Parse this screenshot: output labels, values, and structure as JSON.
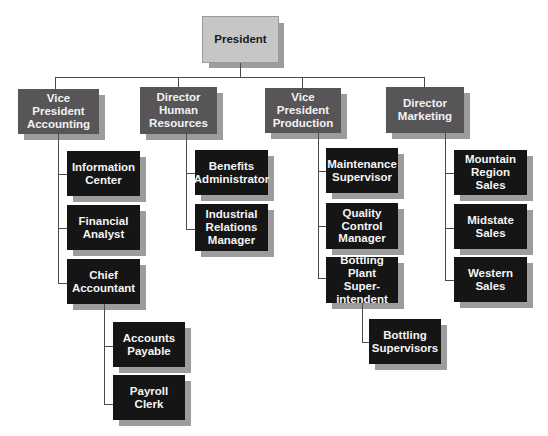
{
  "heading_fragment": "row",
  "chart": {
    "top": {
      "label": "President"
    },
    "departments": [
      {
        "label": "Vice President\nAccounting",
        "children": [
          {
            "label": "Information\nCenter"
          },
          {
            "label": "Financial\nAnalyst"
          },
          {
            "label": "Chief\nAccountant",
            "children": [
              {
                "label": "Accounts\nPayable"
              },
              {
                "label": "Payroll Clerk"
              }
            ]
          }
        ]
      },
      {
        "label": "Director\nHuman\nResources",
        "children": [
          {
            "label": "Benefits\nAdministrator"
          },
          {
            "label": "Industrial\nRelations\nManager"
          }
        ]
      },
      {
        "label": "Vice President\nProduction",
        "children": [
          {
            "label": "Maintenance\nSupervisor"
          },
          {
            "label": "Quality\nControl\nManager"
          },
          {
            "label": "Bottling Plant\nSuper-\nintendent",
            "children": [
              {
                "label": "Bottling\nSupervisors"
              }
            ]
          }
        ]
      },
      {
        "label": "Director\nMarketing",
        "children": [
          {
            "label": "Mountain\nRegion Sales"
          },
          {
            "label": "Midstate\nSales"
          },
          {
            "label": "Western\nSales"
          }
        ]
      }
    ]
  },
  "colors": {
    "president_fill": "#c6c6c6",
    "department_fill": "#575558",
    "staff_fill": "#151515",
    "shadow": "#9c9c9c",
    "connector": "#4a4a4a"
  }
}
